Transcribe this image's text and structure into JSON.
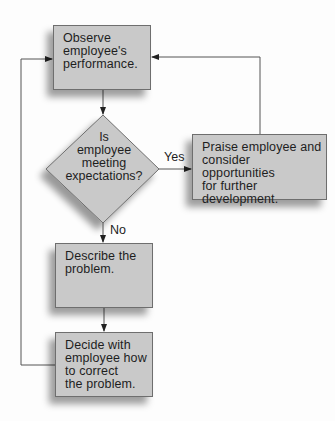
{
  "diagram": {
    "type": "flowchart",
    "colors": {
      "box_fill": "#c9c9c9",
      "box_border": "#6e6e6e",
      "line": "#555555",
      "text": "#1e1e1e",
      "background": "#fdfdfd"
    },
    "nodes": [
      {
        "id": "observe",
        "shape": "rectangle",
        "text": "Observe\nemployee's\nperformance."
      },
      {
        "id": "decision",
        "shape": "diamond",
        "text": "Is\nemployee\nmeeting\nexpectations?"
      },
      {
        "id": "praise",
        "shape": "rectangle",
        "text": "Praise employee and\nconsider opportunities\nfor further\ndevelopment."
      },
      {
        "id": "describe",
        "shape": "rectangle",
        "text": "Describe the\nproblem."
      },
      {
        "id": "decide",
        "shape": "rectangle",
        "text": "Decide with\nemployee how\nto correct\nthe problem."
      }
    ],
    "edges": [
      {
        "from": "observe",
        "to": "decision",
        "label": ""
      },
      {
        "from": "decision",
        "to": "praise",
        "label": "Yes"
      },
      {
        "from": "decision",
        "to": "describe",
        "label": "No"
      },
      {
        "from": "describe",
        "to": "decide",
        "label": ""
      },
      {
        "from": "praise",
        "to": "observe",
        "label": ""
      },
      {
        "from": "decide",
        "to": "observe",
        "label": ""
      }
    ],
    "labels": {
      "yes": "Yes",
      "no": "No"
    }
  }
}
